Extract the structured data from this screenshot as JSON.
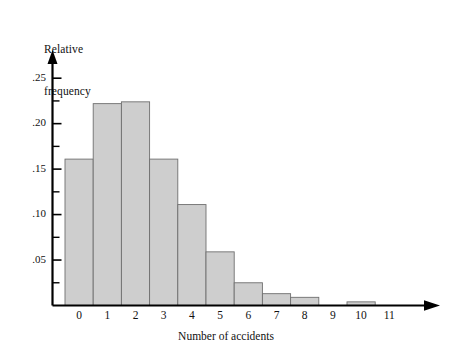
{
  "chart_data": {
    "type": "bar",
    "title": "",
    "xlabel": "Number of accidents",
    "ylabel": "Relative frequency",
    "ylabel_lines": [
      "Relative",
      "frequency"
    ],
    "categories": [
      "0",
      "1",
      "2",
      "3",
      "4",
      "5",
      "6",
      "7",
      "8",
      "9",
      "10",
      "11"
    ],
    "values": [
      0.161,
      0.222,
      0.224,
      0.161,
      0.111,
      0.059,
      0.025,
      0.013,
      0.009,
      0.0,
      0.004,
      0.0
    ],
    "ylim": [
      0,
      0.27
    ],
    "xlim": [
      -0.5,
      11.5
    ],
    "ytick_labels": [
      ".05",
      ".10",
      ".15",
      ".20",
      ".25"
    ],
    "ytick_values": [
      0.05,
      0.1,
      0.15,
      0.2,
      0.25
    ],
    "yminor_values": [
      0.025,
      0.075,
      0.125,
      0.175,
      0.225
    ],
    "grid": false,
    "legend": null,
    "bar_fill": "#cecece",
    "bar_stroke": "#6f6f6f",
    "axis_color": "#000000",
    "text_color": "#111111",
    "axis_arrows": true,
    "bar_width_ratio": 1.0
  }
}
